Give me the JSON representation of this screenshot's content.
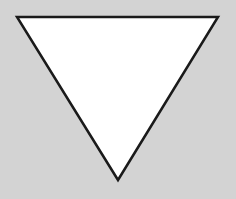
{
  "canvas": {
    "width": 236,
    "height": 199,
    "background": "#d3d3d3"
  },
  "shape": {
    "type": "inverted-triangle",
    "points": "17,17 218,17 118,180",
    "fill": "#ffffff",
    "stroke": "#1a1a1a",
    "stroke_width": 2.5
  }
}
